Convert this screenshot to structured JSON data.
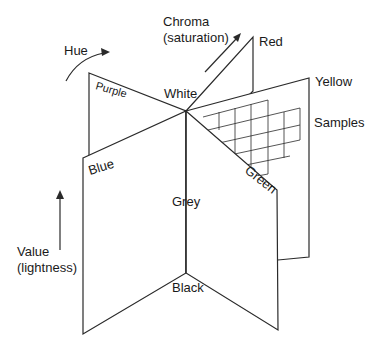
{
  "diagram": {
    "type": "munsell-color-solid",
    "center_label": "White",
    "bottom_label": "Black",
    "axis_label": "Grey",
    "hue_pages": [
      {
        "name": "Red"
      },
      {
        "name": "Yellow"
      },
      {
        "name": "Green"
      },
      {
        "name": "Blue"
      },
      {
        "name": "Purple"
      }
    ],
    "annotations": {
      "hue": "Hue",
      "chroma_line1": "Chroma",
      "chroma_line2": "(saturation)",
      "value_line1": "Value",
      "value_line2": "(lightness)",
      "samples": "Samples"
    }
  },
  "colors": {
    "line": "#2a2a2a",
    "background": "#ffffff",
    "text": "#1a1a1a"
  }
}
